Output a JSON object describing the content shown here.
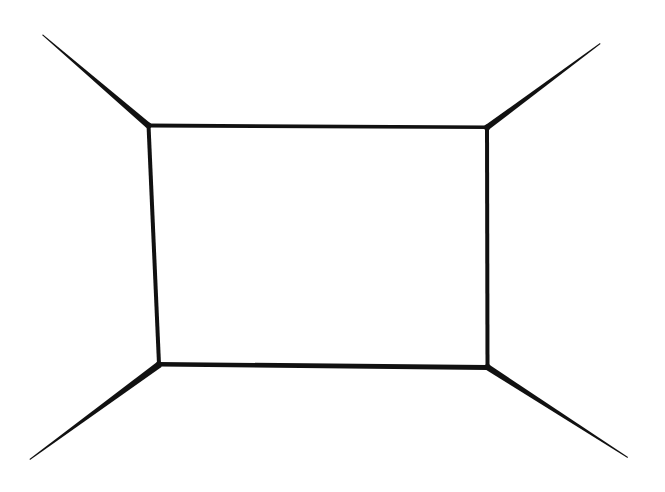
{
  "drawing": {
    "subject": "hand-drawn one-point perspective room outline",
    "background": "#ffffff",
    "stroke_color": "#111111",
    "back_wall": {
      "top_left": [
        148,
        125
      ],
      "top_right": [
        487,
        127
      ],
      "bottom_right": [
        487,
        367
      ],
      "bottom_left": [
        159,
        364
      ]
    },
    "corner_lines": {
      "top_left_end": [
        42,
        35
      ],
      "top_right_end": [
        600,
        43
      ],
      "bottom_left_end": [
        30,
        460
      ],
      "bottom_right_end": [
        628,
        457
      ]
    }
  }
}
